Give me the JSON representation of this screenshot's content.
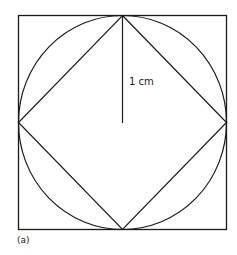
{
  "diagram": {
    "radius_label": "1 cm",
    "caption": "(a)",
    "shapes": {
      "outer_square": {
        "x": 18,
        "y": 15,
        "size": 209
      },
      "circle": {
        "cx": 122.5,
        "cy": 119.5,
        "r": 104.5
      },
      "inner_square_vertices": [
        [
          122.5,
          15
        ],
        [
          227,
          119.5
        ],
        [
          122.5,
          224
        ],
        [
          18,
          119.5
        ]
      ],
      "radius_line": {
        "x1": 122.5,
        "y1": 15,
        "x2": 122.5,
        "y2": 122
      }
    },
    "stroke_color": "#1a1a1a"
  }
}
